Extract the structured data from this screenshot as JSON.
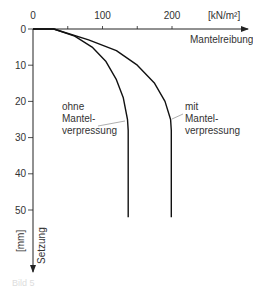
{
  "chart_data": {
    "type": "line",
    "title": "",
    "xlabel": "Mantelreibung",
    "x_unit": "[kN/m²]",
    "ylabel": "Setzung",
    "y_unit": "[mm]",
    "x_ticks": [
      "0",
      "100",
      "200"
    ],
    "y_ticks": [
      "0",
      "10",
      "20",
      "30",
      "40",
      "50"
    ],
    "xlim": [
      0,
      300
    ],
    "ylim": [
      0,
      60
    ],
    "grid": false,
    "series": [
      {
        "name": "ohne Mantelverpressung",
        "label_lines": [
          "ohne",
          "Mantel-",
          "verpressung"
        ],
        "points": [
          [
            0,
            0
          ],
          [
            30,
            0
          ],
          [
            60,
            2
          ],
          [
            85,
            5
          ],
          [
            105,
            9
          ],
          [
            120,
            14
          ],
          [
            130,
            19
          ],
          [
            136,
            25
          ],
          [
            137,
            28
          ],
          [
            137,
            52
          ]
        ]
      },
      {
        "name": "mit Mantelverpressung",
        "label_lines": [
          "mit",
          "Mantel-",
          "verpressung"
        ],
        "points": [
          [
            0,
            0
          ],
          [
            30,
            0
          ],
          [
            80,
            3
          ],
          [
            120,
            6
          ],
          [
            150,
            10
          ],
          [
            175,
            15
          ],
          [
            190,
            20
          ],
          [
            198,
            25
          ],
          [
            199,
            28
          ],
          [
            199,
            52
          ]
        ]
      }
    ]
  },
  "caption": "Bild 5"
}
